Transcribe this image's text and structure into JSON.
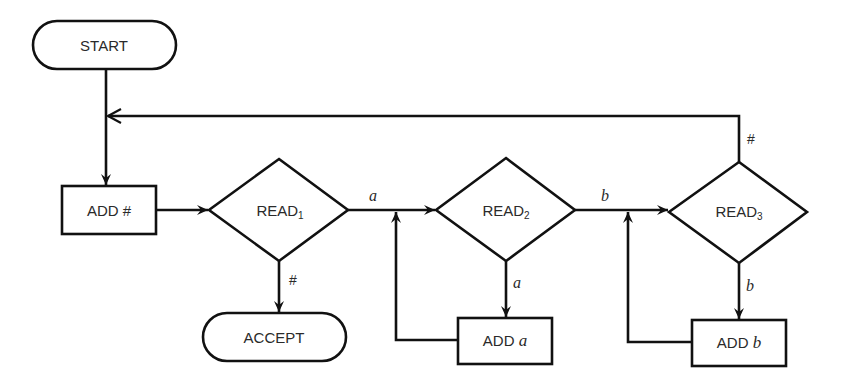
{
  "diagram": {
    "type": "flowchart",
    "nodes": {
      "start": {
        "label": "START",
        "shape": "terminal"
      },
      "add_hash": {
        "label": "ADD #",
        "shape": "process"
      },
      "read1": {
        "label": "READ",
        "sub": "1",
        "shape": "decision"
      },
      "accept": {
        "label": "ACCEPT",
        "shape": "terminal"
      },
      "read2": {
        "label": "READ",
        "sub": "2",
        "shape": "decision"
      },
      "add_a": {
        "label": "ADD",
        "var": "a",
        "shape": "process"
      },
      "read3": {
        "label": "READ",
        "sub": "3",
        "shape": "decision"
      },
      "add_b": {
        "label": "ADD",
        "var": "b",
        "shape": "process"
      }
    },
    "edges": [
      {
        "from": "start",
        "to": "add_hash",
        "label": ""
      },
      {
        "from": "add_hash",
        "to": "read1",
        "label": ""
      },
      {
        "from": "read1",
        "to": "read2",
        "label": "a"
      },
      {
        "from": "read1",
        "to": "accept",
        "label": "#"
      },
      {
        "from": "read2",
        "to": "read3",
        "label": "b"
      },
      {
        "from": "read2",
        "to": "add_a",
        "label": "a"
      },
      {
        "from": "add_a",
        "to": "read2",
        "label": ""
      },
      {
        "from": "read3",
        "to": "add_b",
        "label": "b"
      },
      {
        "from": "add_b",
        "to": "read3",
        "label": ""
      },
      {
        "from": "read3",
        "to": "add_hash",
        "label": "#"
      }
    ],
    "stroke_color": "#111111",
    "text_color": "#2a2a2a"
  }
}
